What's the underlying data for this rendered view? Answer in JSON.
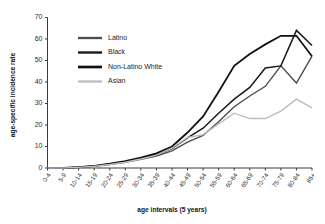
{
  "chart_data": {
    "type": "line",
    "title": "",
    "xlabel": "age intervals (5 years)",
    "ylabel": "age-specific incidence rate",
    "categories": [
      "0-4",
      "5-9",
      "10-14",
      "15-19",
      "20-24",
      "25-29",
      "30-34",
      "35-39",
      "40-44",
      "45-49",
      "50-54",
      "55-59",
      "60-64",
      "65-69",
      "70-74",
      "75-79",
      "80-84",
      "85+"
    ],
    "ylim": [
      0,
      70
    ],
    "yticks": [
      0,
      10,
      20,
      30,
      40,
      50,
      60,
      70
    ],
    "grid": false,
    "legend_position": "upper-left-inside",
    "series": [
      {
        "name": "Latino",
        "color": "#4d4d4d",
        "width": 1.4,
        "values": [
          0,
          0,
          0.3,
          0.8,
          1.6,
          2.6,
          4.0,
          5.6,
          8.0,
          12.0,
          15.2,
          21.5,
          28.5,
          33.5,
          38.0,
          47.5,
          39.5,
          52.0
        ]
      },
      {
        "name": "Black",
        "color": "#1a1a1a",
        "width": 1.5,
        "values": [
          0,
          0,
          0.3,
          0.9,
          1.8,
          3.0,
          4.4,
          6.2,
          9.0,
          14.0,
          18.5,
          25.5,
          32.0,
          37.5,
          46.5,
          47.5,
          64.0,
          57.0
        ]
      },
      {
        "name": "Non-Latino White",
        "color": "#111111",
        "width": 1.8,
        "values": [
          0,
          0,
          0.4,
          1.0,
          2.0,
          3.2,
          4.8,
          6.8,
          10.0,
          16.5,
          24.0,
          35.5,
          47.5,
          53.0,
          57.5,
          61.5,
          61.5,
          52.0
        ]
      },
      {
        "name": "Asian",
        "color": "#bdbdbd",
        "width": 1.4,
        "values": [
          0,
          0,
          0.3,
          0.8,
          1.6,
          2.7,
          4.2,
          6.0,
          9.2,
          14.2,
          15.5,
          20.5,
          25.5,
          23.0,
          23.0,
          26.5,
          32.0,
          28.0
        ]
      }
    ]
  },
  "legend": {
    "items": [
      {
        "label": "Latino"
      },
      {
        "label": "Black"
      },
      {
        "label": "Non-Latino White"
      },
      {
        "label": "Asian"
      }
    ]
  }
}
